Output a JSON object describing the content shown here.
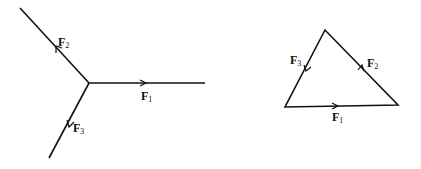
{
  "diagram": {
    "type": "force-vector-diagram",
    "left_figure": {
      "description": "Three concurrent forces acting at a point",
      "origin": [
        89,
        83
      ],
      "vectors": [
        {
          "id": "F1",
          "symbol": "F",
          "subscript": "1",
          "end": [
            205,
            83
          ],
          "arrow_at": [
            145,
            83
          ],
          "label_pos": [
            141,
            100
          ]
        },
        {
          "id": "F2",
          "symbol": "F",
          "subscript": "2",
          "end": [
            20,
            8
          ],
          "arrow_at": [
            57,
            47
          ],
          "label_pos": [
            58,
            45
          ]
        },
        {
          "id": "F3",
          "symbol": "F",
          "subscript": "3",
          "end": [
            49,
            158
          ],
          "arrow_at": [
            70,
            124
          ],
          "label_pos": [
            73,
            132
          ]
        }
      ]
    },
    "right_figure": {
      "description": "Closed force triangle (vector sum equals zero)",
      "vertices": {
        "top": [
          325,
          30
        ],
        "bottom_left": [
          285,
          107
        ],
        "bottom_right": [
          398,
          105
        ]
      },
      "vectors": [
        {
          "id": "F1",
          "symbol": "F",
          "subscript": "1",
          "from": "bottom_left",
          "to": "bottom_right",
          "arrow_at": [
            337,
            106
          ],
          "label_pos": [
            332,
            121
          ]
        },
        {
          "id": "F2",
          "symbol": "F",
          "subscript": "2",
          "from": "bottom_right",
          "to": "top",
          "arrow_at": [
            362,
            68
          ],
          "label_pos": [
            367,
            67
          ]
        },
        {
          "id": "F3",
          "symbol": "F",
          "subscript": "3",
          "from": "top",
          "to": "bottom_left",
          "arrow_at": [
            307,
            68
          ],
          "label_pos": [
            290,
            64
          ]
        }
      ]
    }
  }
}
